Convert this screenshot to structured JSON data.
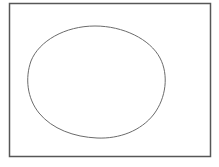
{
  "canvas": {
    "width": 219,
    "height": 167,
    "background_color": "#ffffff",
    "description": "Plain white page showing a hand-drawn style line figure"
  },
  "figure": {
    "stroke_color": "#6b6b6b",
    "frame_stroke_color": "#575757",
    "fill_color": "none"
  },
  "shapes": {
    "frame": {
      "name": "rectangle-frame",
      "type": "rectangle",
      "x": 9.5,
      "y": 3.5,
      "width": 201,
      "height": 153,
      "stroke_width": 1.5,
      "stroke": "#575757",
      "fill": "none"
    },
    "egg": {
      "name": "egg-outline",
      "type": "closed-curve",
      "center_x": 95,
      "center_y": 82,
      "left_extreme_x": 27,
      "right_extreme_x": 163,
      "top_extreme_y": 26,
      "bottom_extreme_y": 138,
      "stroke_width": 1,
      "stroke": "#6b6b6b",
      "fill": "none",
      "path": "M 95 26 C 123 26 150 39 160 58 C 169 75 166 98 154 114 C 141 131 119 139 97 138 C 74 137 52 129 39 113 C 27 98 25 78 31 61 C 39 41 65 26 95 26 Z"
    }
  }
}
